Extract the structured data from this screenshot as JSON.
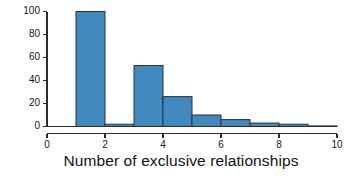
{
  "chart_data": {
    "type": "bar",
    "title": "",
    "xlabel": "Number of exclusive relationships",
    "ylabel": "",
    "categories": [
      "0-1",
      "1-2",
      "2-3",
      "3-4",
      "4-5",
      "5-6",
      "6-7",
      "7-8",
      "8-9",
      "9-10"
    ],
    "bin_edges": [
      0,
      1,
      2,
      3,
      4,
      5,
      6,
      7,
      8,
      9,
      10
    ],
    "values": [
      0,
      100,
      2,
      53,
      26,
      10,
      6,
      3,
      2,
      0.5
    ],
    "xlim": [
      0,
      10
    ],
    "ylim": [
      0,
      100
    ],
    "xticks": [
      0,
      2,
      4,
      6,
      8,
      10
    ],
    "yticks": [
      0,
      20,
      40,
      60,
      80,
      100
    ],
    "xtick_labels": [
      "0",
      "2",
      "4",
      "6",
      "8",
      "10"
    ],
    "ytick_labels": [
      "0",
      "20",
      "40",
      "60",
      "80",
      "100"
    ],
    "grid": false,
    "legend": false,
    "bar_fill_color": "#4189bf",
    "bar_edge_color": "#27333f",
    "axis_color": "#2b2b2b",
    "background_color": "#ffffff"
  },
  "axis_title": "Number of exclusive relationships"
}
